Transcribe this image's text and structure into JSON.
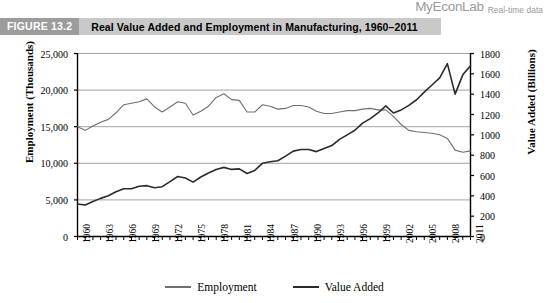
{
  "brand": {
    "name": "MyEconLab",
    "tagline": "Real-time data"
  },
  "figure": {
    "label": "FIGURE 13.2",
    "title": "Real Value Added and Employment in Manufacturing, 1960–2011"
  },
  "legend": {
    "employment_label": "Employment",
    "value_added_label": "Value Added"
  },
  "colors": {
    "banner_bg": "#c9c9c9",
    "banner_label_bg": "#9c9c9c",
    "employment_line": "#6f6f6f",
    "value_added_line": "#2b2b2b",
    "gridline": "#8a8a8a",
    "axis": "#000000"
  },
  "chart_data": {
    "type": "line",
    "title": "Real Value Added and Employment in Manufacturing, 1960–2011",
    "xlabel": "",
    "ylabel": "Employment (Thousands)",
    "y2label": "Value Added (Billions)",
    "grid": true,
    "legend_position": "bottom",
    "xlim": [
      1960,
      2011
    ],
    "ylim": [
      0,
      25000
    ],
    "y2lim": [
      0,
      1800
    ],
    "yticks": [
      "0",
      "5,000",
      "10,000",
      "15,000",
      "20,000",
      "25,000"
    ],
    "ytick_values": [
      0,
      5000,
      10000,
      15000,
      20000,
      25000
    ],
    "y2ticks": [
      "0",
      "200",
      "400",
      "600",
      "800",
      "1000",
      "1200",
      "1400",
      "1600",
      "1800"
    ],
    "y2tick_values": [
      0,
      200,
      400,
      600,
      800,
      1000,
      1200,
      1400,
      1600,
      1800
    ],
    "xticks": [
      "1960",
      "1963",
      "1966",
      "1969",
      "1972",
      "1975",
      "1978",
      "1981",
      "1984",
      "1987",
      "1990",
      "1993",
      "1996",
      "1999",
      "2002",
      "2005",
      "2008",
      "2011"
    ],
    "x": [
      1960,
      1961,
      1962,
      1963,
      1964,
      1965,
      1966,
      1967,
      1968,
      1969,
      1970,
      1971,
      1972,
      1973,
      1974,
      1975,
      1976,
      1977,
      1978,
      1979,
      1980,
      1981,
      1982,
      1983,
      1984,
      1985,
      1986,
      1987,
      1988,
      1989,
      1990,
      1991,
      1992,
      1993,
      1994,
      1995,
      1996,
      1997,
      1998,
      1999,
      2000,
      2001,
      2002,
      2003,
      2004,
      2005,
      2006,
      2007,
      2008,
      2009,
      2010,
      2011
    ],
    "series": [
      {
        "name": "Employment",
        "axis": "left",
        "units": "Thousands",
        "values": [
          15000,
          14500,
          15100,
          15600,
          16000,
          16900,
          18000,
          18200,
          18400,
          18800,
          17700,
          17000,
          17700,
          18400,
          18200,
          16600,
          17100,
          17800,
          19000,
          19500,
          18700,
          18600,
          17000,
          17000,
          18000,
          17800,
          17400,
          17500,
          17900,
          17900,
          17700,
          17100,
          16800,
          16800,
          17000,
          17200,
          17200,
          17400,
          17500,
          17300,
          17300,
          16400,
          15300,
          14500,
          14300,
          14200,
          14100,
          13900,
          13400,
          11800,
          11500,
          11700
        ]
      },
      {
        "name": "Value Added",
        "axis": "right",
        "units": "Billions",
        "values": [
          320,
          310,
          345,
          375,
          400,
          440,
          470,
          470,
          495,
          500,
          480,
          490,
          540,
          590,
          575,
          535,
          585,
          625,
          660,
          680,
          660,
          665,
          620,
          650,
          720,
          735,
          745,
          790,
          840,
          855,
          855,
          835,
          865,
          895,
          955,
          1000,
          1045,
          1115,
          1160,
          1215,
          1285,
          1215,
          1245,
          1290,
          1345,
          1420,
          1490,
          1560,
          1700,
          1400,
          1590,
          1680
        ]
      }
    ]
  }
}
